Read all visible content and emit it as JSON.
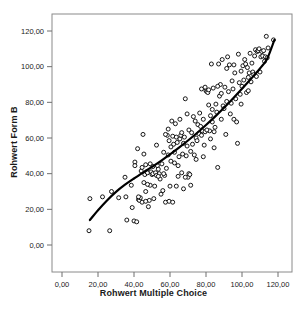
{
  "chart_data": {
    "type": "scatter",
    "title": "",
    "xlabel": "Rohwert Multiple Choice",
    "ylabel": "Rohwert Form B",
    "xlim": [
      -5,
      128
    ],
    "ylim": [
      -5,
      128
    ],
    "xticks": [
      0,
      20,
      40,
      60,
      80,
      100,
      120
    ],
    "yticks": [
      0,
      20,
      40,
      60,
      80,
      100,
      120
    ],
    "xticklabels": [
      "0,00",
      "20,00",
      "40,00",
      "60,00",
      "80,00",
      "100,00",
      "120,00"
    ],
    "yticklabels": [
      "0,00",
      "20,00",
      "40,00",
      "60,00",
      "80,00",
      "100,00",
      "120,00"
    ],
    "grid": false,
    "legend": false,
    "marker": {
      "shape": "open-circle",
      "size": 4,
      "edge_color": "#000000",
      "face_color": "#ffffff",
      "edge_width": 0.9
    },
    "fit_line": {
      "kind": "loess-quadratic",
      "color": "#000000",
      "width": 2.2,
      "points": [
        [
          15.5,
          14.0
        ],
        [
          20,
          19.5
        ],
        [
          25,
          25.0
        ],
        [
          30,
          29.8
        ],
        [
          35,
          33.8
        ],
        [
          40,
          37.3
        ],
        [
          45,
          40.6
        ],
        [
          50,
          43.8
        ],
        [
          55,
          47.2
        ],
        [
          60,
          50.8
        ],
        [
          65,
          54.6
        ],
        [
          70,
          58.6
        ],
        [
          75,
          62.8
        ],
        [
          80,
          67.3
        ],
        [
          85,
          72.0
        ],
        [
          90,
          77.0
        ],
        [
          95,
          82.2
        ],
        [
          100,
          87.6
        ],
        [
          105,
          93.2
        ],
        [
          110,
          99.0
        ],
        [
          114,
          104.5
        ],
        [
          118,
          115.0
        ]
      ]
    },
    "points": [
      [
        15.0,
        8.0
      ],
      [
        15.5,
        26.0
      ],
      [
        22.5,
        27.0
      ],
      [
        26.5,
        8.0
      ],
      [
        27.5,
        30.0
      ],
      [
        31.5,
        26.5
      ],
      [
        35.0,
        38.0
      ],
      [
        35.5,
        27.0
      ],
      [
        36.0,
        14.0
      ],
      [
        38.5,
        33.5
      ],
      [
        39.0,
        21.0
      ],
      [
        40.0,
        13.5
      ],
      [
        40.5,
        46.5
      ],
      [
        40.5,
        44.5
      ],
      [
        41.5,
        13.0
      ],
      [
        42.0,
        54.0
      ],
      [
        42.5,
        25.5
      ],
      [
        43.0,
        25.0
      ],
      [
        43.5,
        26.5
      ],
      [
        44.0,
        41.5
      ],
      [
        44.5,
        43.5
      ],
      [
        45.0,
        62.0
      ],
      [
        45.5,
        51.0
      ],
      [
        46.0,
        39.5
      ],
      [
        46.5,
        45.0
      ],
      [
        46.5,
        30.0
      ],
      [
        47.0,
        41.0
      ],
      [
        47.5,
        40.5
      ],
      [
        48.0,
        21.5
      ],
      [
        48.5,
        25.0
      ],
      [
        49.0,
        33.5
      ],
      [
        49.5,
        41.0
      ],
      [
        50.0,
        39.5
      ],
      [
        50.5,
        40.0
      ],
      [
        51.0,
        26.0
      ],
      [
        51.5,
        33.0
      ],
      [
        52.0,
        40.5
      ],
      [
        52.5,
        56.0
      ],
      [
        53.0,
        44.5
      ],
      [
        53.5,
        42.5
      ],
      [
        54.0,
        40.0
      ],
      [
        54.5,
        37.0
      ],
      [
        55.0,
        28.5
      ],
      [
        55.5,
        45.5
      ],
      [
        56.0,
        30.5
      ],
      [
        56.5,
        52.0
      ],
      [
        57.0,
        39.0
      ],
      [
        57.5,
        24.0
      ],
      [
        58.0,
        43.0
      ],
      [
        58.5,
        61.5
      ],
      [
        59.0,
        50.5
      ],
      [
        59.5,
        58.5
      ],
      [
        60.0,
        33.0
      ],
      [
        60.5,
        47.0
      ],
      [
        61.0,
        69.5
      ],
      [
        61.5,
        61.0
      ],
      [
        62.0,
        56.5
      ],
      [
        62.5,
        46.0
      ],
      [
        63.0,
        68.0
      ],
      [
        63.5,
        60.5
      ],
      [
        64.0,
        57.5
      ],
      [
        64.5,
        44.5
      ],
      [
        65.0,
        49.5
      ],
      [
        65.5,
        59.5
      ],
      [
        66.0,
        61.5
      ],
      [
        66.5,
        63.0
      ],
      [
        67.0,
        51.0
      ],
      [
        67.5,
        57.0
      ],
      [
        68.0,
        60.5
      ],
      [
        68.5,
        82.0
      ],
      [
        69.0,
        50.0
      ],
      [
        69.5,
        55.5
      ],
      [
        70.0,
        38.0
      ],
      [
        70.5,
        40.0
      ],
      [
        71.0,
        39.5
      ],
      [
        71.5,
        52.5
      ],
      [
        72.0,
        63.0
      ],
      [
        72.5,
        56.5
      ],
      [
        73.0,
        72.0
      ],
      [
        73.5,
        50.5
      ],
      [
        74.0,
        69.5
      ],
      [
        74.5,
        60.0
      ],
      [
        75.0,
        58.5
      ],
      [
        75.5,
        67.5
      ],
      [
        76.0,
        62.5
      ],
      [
        76.5,
        74.0
      ],
      [
        77.0,
        66.5
      ],
      [
        77.5,
        61.5
      ],
      [
        78.0,
        64.0
      ],
      [
        78.5,
        70.5
      ],
      [
        79.0,
        56.0
      ],
      [
        79.5,
        63.5
      ],
      [
        80.0,
        86.5
      ],
      [
        80.5,
        86.0
      ],
      [
        81.0,
        85.5
      ],
      [
        81.5,
        87.0
      ],
      [
        82.0,
        64.0
      ],
      [
        82.5,
        72.5
      ],
      [
        83.0,
        101.5
      ],
      [
        83.5,
        76.0
      ],
      [
        84.0,
        88.0
      ],
      [
        84.5,
        63.5
      ],
      [
        85.0,
        66.0
      ],
      [
        85.5,
        79.0
      ],
      [
        86.0,
        74.5
      ],
      [
        86.5,
        43.5
      ],
      [
        87.0,
        101.5
      ],
      [
        87.5,
        83.5
      ],
      [
        88.0,
        90.0
      ],
      [
        88.5,
        70.5
      ],
      [
        89.0,
        104.0
      ],
      [
        89.5,
        78.0
      ],
      [
        90.0,
        76.5
      ],
      [
        90.5,
        88.5
      ],
      [
        91.0,
        62.0
      ],
      [
        91.5,
        80.5
      ],
      [
        92.0,
        105.5
      ],
      [
        92.5,
        86.0
      ],
      [
        93.0,
        101.0
      ],
      [
        93.5,
        73.5
      ],
      [
        94.0,
        79.5
      ],
      [
        94.5,
        92.0
      ],
      [
        95.0,
        87.5
      ],
      [
        95.5,
        70.5
      ],
      [
        96.0,
        96.5
      ],
      [
        96.5,
        82.0
      ],
      [
        97.0,
        69.0
      ],
      [
        97.5,
        57.0
      ],
      [
        98.0,
        107.0
      ],
      [
        98.5,
        91.0
      ],
      [
        99.0,
        84.5
      ],
      [
        99.5,
        97.5
      ],
      [
        100.0,
        89.0
      ],
      [
        100.5,
        100.5
      ],
      [
        101.0,
        92.5
      ],
      [
        101.5,
        104.0
      ],
      [
        102.0,
        101.5
      ],
      [
        102.5,
        85.5
      ],
      [
        103.0,
        99.5
      ],
      [
        103.5,
        94.0
      ],
      [
        104.0,
        96.5
      ],
      [
        104.5,
        107.5
      ],
      [
        105.0,
        91.5
      ],
      [
        105.5,
        102.0
      ],
      [
        106.0,
        97.0
      ],
      [
        106.5,
        95.5
      ],
      [
        107.0,
        106.0
      ],
      [
        107.5,
        109.5
      ],
      [
        108.0,
        94.5
      ],
      [
        108.5,
        108.5
      ],
      [
        109.0,
        109.0
      ],
      [
        109.5,
        110.0
      ],
      [
        110.0,
        97.0
      ],
      [
        110.5,
        105.5
      ],
      [
        111.0,
        108.5
      ],
      [
        111.5,
        106.0
      ],
      [
        112.0,
        109.0
      ],
      [
        112.5,
        103.0
      ],
      [
        113.0,
        105.5
      ],
      [
        113.5,
        117.0
      ],
      [
        114.0,
        105.0
      ],
      [
        114.5,
        110.5
      ],
      [
        117.5,
        115.0
      ],
      [
        49.0,
        45.5
      ],
      [
        50.5,
        44.0
      ],
      [
        52.5,
        39.0
      ],
      [
        53.5,
        38.5
      ],
      [
        56.5,
        40.0
      ],
      [
        60.5,
        55.0
      ],
      [
        62.5,
        52.0
      ],
      [
        64.5,
        38.5
      ],
      [
        66.5,
        40.5
      ],
      [
        68.5,
        38.0
      ],
      [
        70.5,
        64.5
      ],
      [
        74.5,
        48.0
      ],
      [
        78.5,
        49.5
      ],
      [
        80.5,
        64.5
      ],
      [
        82.5,
        59.5
      ],
      [
        84.5,
        54.5
      ],
      [
        45.5,
        35.0
      ],
      [
        47.5,
        34.0
      ],
      [
        59.5,
        24.5
      ],
      [
        61.5,
        24.0
      ],
      [
        63.5,
        33.0
      ],
      [
        67.5,
        31.5
      ],
      [
        71.5,
        33.5
      ],
      [
        44.5,
        24.0
      ],
      [
        46.5,
        24.5
      ],
      [
        42.5,
        27.0
      ],
      [
        57.5,
        62.0
      ],
      [
        59.0,
        65.0
      ],
      [
        65.5,
        70.5
      ],
      [
        69.5,
        73.5
      ],
      [
        77.5,
        87.5
      ],
      [
        79.5,
        88.5
      ],
      [
        91.5,
        99.0
      ],
      [
        95.5,
        101.0
      ],
      [
        99.5,
        79.0
      ],
      [
        103.5,
        86.5
      ],
      [
        86.5,
        89.0
      ],
      [
        88.5,
        85.0
      ],
      [
        81.5,
        78.5
      ],
      [
        83.5,
        69.0
      ]
    ]
  },
  "axis": {
    "x_title": "Rohwert Multiple Choice",
    "y_title": "Rohwert Form B"
  }
}
